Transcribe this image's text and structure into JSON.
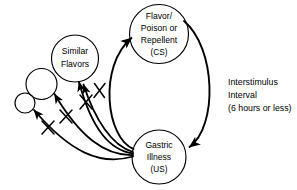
{
  "figure": {
    "background_color": "#ffffff",
    "stroke_color": "#000000",
    "width": 297,
    "height": 190
  },
  "nodes": [
    {
      "id": "cs",
      "name": "flavor-poison-repellent-node",
      "lines": [
        "Flavor/",
        "Poison or",
        "Repellent",
        "(CS)"
      ],
      "cx": 159,
      "cy": 34,
      "r": 29.5
    },
    {
      "id": "us",
      "name": "gastric-illness-node",
      "lines": [
        "Gastric",
        "Illness",
        "(US)"
      ],
      "cx": 159,
      "cy": 157,
      "r": 27
    },
    {
      "id": "similar",
      "name": "similar-flavors-node",
      "lines": [
        "Similar",
        "Flavors"
      ],
      "cx": 75,
      "cy": 58.5,
      "r": 23.5
    },
    {
      "id": "generalized-medium",
      "name": "generalized-flavor-node-medium",
      "lines": [],
      "cx": 41.5,
      "cy": 84,
      "r": 15.5
    },
    {
      "id": "generalized-small",
      "name": "generalized-flavor-node-small",
      "lines": [],
      "cx": 25,
      "cy": 103,
      "r": 10
    }
  ],
  "annotations": {
    "interstimulus": {
      "name": "interstimulus-interval-label",
      "lines": [
        "Interstimulus",
        "Interval",
        "(6 hours or less)"
      ],
      "x": 228,
      "y": 85,
      "line_height": 13
    }
  },
  "edges": [
    {
      "id": "us-to-cs",
      "name": "edge-us-to-cs",
      "label": "",
      "from": "us",
      "to": "cs",
      "arrowhead": true,
      "blocked": false,
      "stroke_width": 1.9
    },
    {
      "id": "cs-to-us",
      "name": "edge-cs-to-us",
      "label": "Interstimulus Interval (6 hours or less)",
      "from": "cs",
      "to": "us",
      "arrowhead": true,
      "blocked": false,
      "stroke_width": 1.9
    },
    {
      "id": "us-to-similar",
      "name": "edge-us-to-similar-flavors",
      "label": "",
      "from": "us",
      "to": "similar",
      "arrowhead": true,
      "blocked": true,
      "stroke_width": 1.8
    },
    {
      "id": "us-to-similar-2",
      "name": "edge-us-to-similar-flavors-secondary",
      "label": "",
      "from": "us",
      "to": "similar",
      "arrowhead": false,
      "blocked": true,
      "stroke_width": 1.8
    },
    {
      "id": "us-to-medium",
      "name": "edge-us-to-generalized-medium",
      "label": "",
      "from": "us",
      "to": "generalized-medium",
      "arrowhead": true,
      "blocked": true,
      "stroke_width": 1.8
    },
    {
      "id": "us-to-small",
      "name": "edge-us-to-generalized-small",
      "label": "",
      "from": "us",
      "to": "generalized-small",
      "arrowhead": true,
      "blocked": true,
      "stroke_width": 1.8
    }
  ]
}
